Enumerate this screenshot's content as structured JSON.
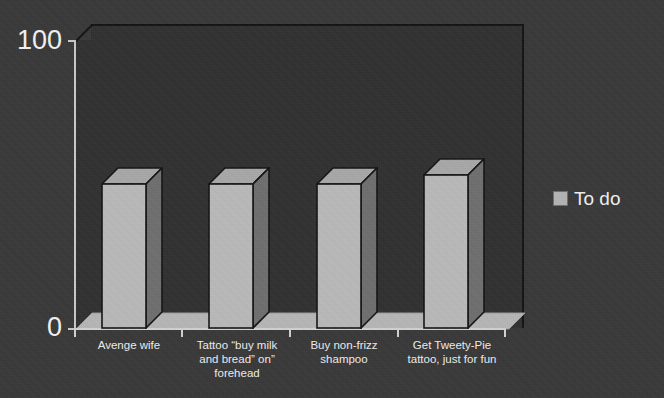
{
  "chart_data": {
    "type": "bar",
    "title": "",
    "subtitle": "",
    "xlabel": "",
    "ylabel": "",
    "ylim": [
      0,
      100
    ],
    "y_ticks": [
      "0",
      "100"
    ],
    "y_tick_values": [
      0,
      100
    ],
    "grid": false,
    "style": "3d-column",
    "legend_position": "right",
    "categories": [
      "Avenge wife",
      "Tattoo \"buy milk and bread\" on\" forehead",
      "Buy non-frizz shampoo",
      "Get Tweety-Pie tattoo, just for fun"
    ],
    "category_lines": [
      [
        "Avenge wife"
      ],
      [
        "Tattoo “buy milk",
        "and bread” on”",
        "forehead"
      ],
      [
        "Buy non-frizz",
        "shampoo"
      ],
      [
        "Get Tweety-Pie",
        "tattoo, just for fun"
      ]
    ],
    "series": [
      {
        "name": "To do",
        "values": [
          50,
          50,
          50,
          53
        ],
        "color": "#b3b3b3"
      }
    ]
  },
  "legend": {
    "items": [
      {
        "label": "To do",
        "swatch_color": "#b3b3b3"
      }
    ]
  },
  "axes": {
    "y_top_label": "100",
    "y_bottom_label": "0"
  },
  "colors": {
    "background": "#393939",
    "plot_background": "#313131",
    "axis_line": "#d2d2d2",
    "bar_front": "#b9b9b9",
    "bar_top": "#a8a8a8",
    "bar_side": "#6f6f6f",
    "bar_outline": "#141414",
    "floor": "#b6b6b6",
    "text": "#f0f0f0"
  }
}
